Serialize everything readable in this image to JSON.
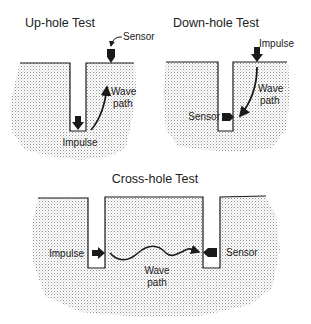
{
  "diagrams": [
    {
      "id": "up-hole",
      "title": "Up-hole Test",
      "labels": {
        "sensor": "Sensor",
        "impulse": "Impulse",
        "wave_line1": "Wave",
        "wave_line2": "path"
      }
    },
    {
      "id": "down-hole",
      "title": "Down-hole Test",
      "labels": {
        "sensor": "Sensor",
        "impulse": "Impulse",
        "wave_line1": "Wave",
        "wave_line2": "path"
      }
    },
    {
      "id": "cross-hole",
      "title": "Cross-hole Test",
      "labels": {
        "sensor": "Sensor",
        "impulse": "Impulse",
        "wave_line1": "Wave",
        "wave_line2": "path"
      }
    }
  ],
  "colors": {
    "ink": "#1a1a1a",
    "soil_dots": "#9a9a9a"
  }
}
